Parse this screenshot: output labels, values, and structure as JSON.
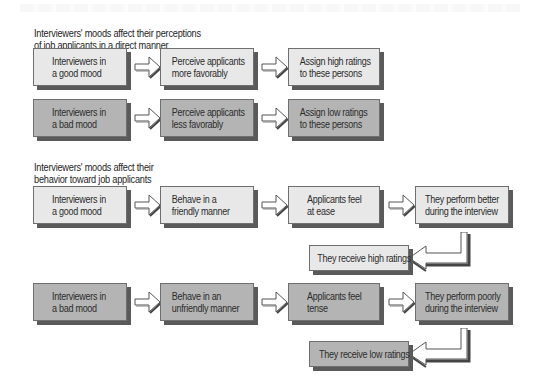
{
  "section1": {
    "title_line1": "Interviewers' moods affect their perceptions",
    "title_line2": "of job applicants in a direct manner",
    "rows": [
      {
        "mood": "good",
        "steps": [
          {
            "line1": "Interviewers in",
            "line2": "a good mood"
          },
          {
            "line1": "Perceive applicants",
            "line2": "more favorably"
          },
          {
            "line1": "Assign high ratings",
            "line2": "to these persons"
          }
        ]
      },
      {
        "mood": "bad",
        "steps": [
          {
            "line1": "Interviewers in",
            "line2": "a bad mood"
          },
          {
            "line1": "Perceive applicants",
            "line2": "less favorably"
          },
          {
            "line1": "Assign low ratings",
            "line2": "to these persons"
          }
        ]
      }
    ]
  },
  "section2": {
    "title_line1": "Interviewers' moods affect their",
    "title_line2": "behavior toward job applicants",
    "rows": [
      {
        "mood": "good",
        "steps": [
          {
            "line1": "Interviewers in",
            "line2": "a good mood"
          },
          {
            "line1": "Behave in a",
            "line2": "friendly manner"
          },
          {
            "line1": "Applicants feel",
            "line2": "at ease"
          },
          {
            "line1": "They perform better",
            "line2": "during the interview"
          }
        ],
        "outcome": "They receive high ratings"
      },
      {
        "mood": "bad",
        "steps": [
          {
            "line1": "Interviewers in",
            "line2": "a bad mood"
          },
          {
            "line1": "Behave in an",
            "line2": "unfriendly manner"
          },
          {
            "line1": "Applicants feel",
            "line2": "tense"
          },
          {
            "line1": "They perform poorly",
            "line2": "during the interview"
          }
        ],
        "outcome": "They receive low ratings"
      }
    ]
  },
  "colors": {
    "good_fill": "#e8e8e8",
    "bad_fill": "#b4b4b4",
    "shadow": "#5a5a5a",
    "border": "#6f6f6f"
  },
  "icons": {
    "flow_arrow": "right-arrow-icon",
    "feedback_arrow": "bent-left-arrow-icon"
  }
}
